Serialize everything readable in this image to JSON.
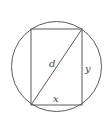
{
  "diagram": {
    "colors": {
      "background": "#ffffff",
      "stroke": "#5a5a5a",
      "label": "#444444"
    },
    "circle": {
      "cx": 56.5,
      "cy": 66.5,
      "r": 45
    },
    "rectangle": {
      "x1": 31,
      "y1": 29,
      "x2": 82,
      "y2": 105
    },
    "diagonal": {
      "from": "bottom-left",
      "to": "top-right"
    },
    "labels": {
      "diagonal": "d",
      "height": "y",
      "width": "x"
    }
  }
}
